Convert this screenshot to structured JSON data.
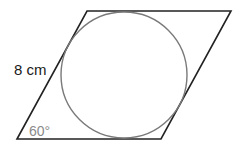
{
  "figure": {
    "type": "rhombus-with-inscribed-circle",
    "side_label": "8 cm",
    "angle_label": "60°",
    "colors": {
      "rhombus_stroke": "#222222",
      "circle_stroke": "#7a7a7a",
      "side_label": "#1a1a1a",
      "angle_label": "#8a8a8a"
    }
  }
}
